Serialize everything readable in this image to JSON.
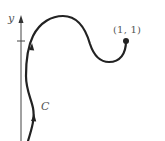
{
  "diagram": {
    "type": "parametric-curve-sketch",
    "axis": {
      "label": "y",
      "tick_mark": true,
      "tick_value_implied": "1"
    },
    "curve": {
      "label": "C",
      "endpoint_label": "(1, 1)",
      "direction_arrows": 2,
      "endpoint_marker": "filled-dot"
    },
    "colors": {
      "curve": "#222222",
      "axis": "#444444",
      "text": "#555555",
      "background": "#ffffff"
    }
  }
}
